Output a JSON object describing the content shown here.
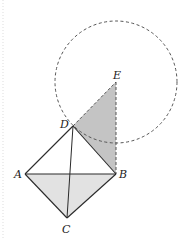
{
  "figure": {
    "type": "geometry",
    "colors": {
      "stroke": "#2a2a2a",
      "dashed": "#555555",
      "shade_dark": "#c4c4c4",
      "shade_light": "#e2e2e2",
      "background": "#ffffff"
    },
    "points": {
      "A": {
        "label": "A",
        "x": 25,
        "y": 174
      },
      "B": {
        "label": "B",
        "x": 116,
        "y": 174
      },
      "C": {
        "label": "C",
        "x": 67,
        "y": 218
      },
      "D": {
        "label": "D",
        "x": 73,
        "y": 126
      },
      "E": {
        "label": "E",
        "x": 116,
        "y": 82
      }
    },
    "circle": {
      "center": "E",
      "cx": 116,
      "cy": 82,
      "r": 61,
      "style": "dashed"
    },
    "shaded_regions": [
      {
        "vertices": [
          "D",
          "E",
          "B"
        ],
        "shade": "dark"
      },
      {
        "vertices": [
          "A",
          "C",
          "B"
        ],
        "shade": "light"
      }
    ],
    "segments": [
      {
        "from": "A",
        "to": "D",
        "style": "solid"
      },
      {
        "from": "D",
        "to": "B",
        "style": "solid"
      },
      {
        "from": "B",
        "to": "C",
        "style": "solid"
      },
      {
        "from": "C",
        "to": "A",
        "style": "solid"
      },
      {
        "from": "A",
        "to": "B",
        "style": "solid"
      },
      {
        "from": "D",
        "to": "C",
        "style": "solid"
      },
      {
        "from": "D",
        "to": "E",
        "style": "dashed"
      },
      {
        "from": "E",
        "to": "B",
        "style": "dashed"
      }
    ]
  }
}
